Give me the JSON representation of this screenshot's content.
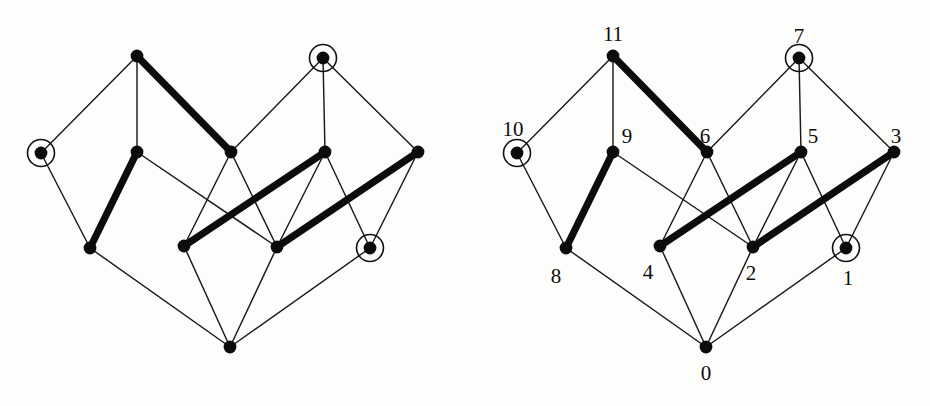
{
  "figure": {
    "background_color": "#fdfdfc",
    "ink_color": "#0b0b0b",
    "panels": [
      {
        "id": "left",
        "name": "unlabeled-graph",
        "x_offset": 0,
        "labels_visible": false
      },
      {
        "id": "right",
        "name": "labeled-graph",
        "x_offset": 476,
        "labels_visible": true
      }
    ]
  },
  "chart_data": {
    "type": "diagram",
    "title": "",
    "xlabel": "",
    "ylabel": "",
    "node_count": 12,
    "edge_count": 20,
    "nodes": [
      {
        "id": "0",
        "label": "0",
        "x": 230,
        "y": 347,
        "highlighted": false,
        "label_dx": 0,
        "label_dy": 26,
        "label_anchor": "middle"
      },
      {
        "id": "1",
        "label": "1",
        "x": 370,
        "y": 248,
        "highlighted": true,
        "label_dx": 2,
        "label_dy": 30,
        "label_anchor": "middle"
      },
      {
        "id": "2",
        "label": "2",
        "x": 277,
        "y": 247,
        "highlighted": false,
        "label_dx": -2,
        "label_dy": 26,
        "label_anchor": "middle"
      },
      {
        "id": "3",
        "label": "3",
        "x": 418,
        "y": 152,
        "highlighted": false,
        "label_dx": 2,
        "label_dy": -16,
        "label_anchor": "middle"
      },
      {
        "id": "4",
        "label": "4",
        "x": 184,
        "y": 246,
        "highlighted": false,
        "label_dx": -12,
        "label_dy": 26,
        "label_anchor": "middle"
      },
      {
        "id": "5",
        "label": "5",
        "x": 325,
        "y": 152,
        "highlighted": false,
        "label_dx": 12,
        "label_dy": -16,
        "label_anchor": "middle"
      },
      {
        "id": "6",
        "label": "6",
        "x": 231,
        "y": 152,
        "highlighted": false,
        "label_dx": -2,
        "label_dy": -16,
        "label_anchor": "middle"
      },
      {
        "id": "7",
        "label": "7",
        "x": 323,
        "y": 58,
        "highlighted": true,
        "label_dx": 0,
        "label_dy": -22,
        "label_anchor": "middle"
      },
      {
        "id": "8",
        "label": "8",
        "x": 90,
        "y": 248,
        "highlighted": false,
        "label_dx": -10,
        "label_dy": 28,
        "label_anchor": "middle"
      },
      {
        "id": "9",
        "label": "9",
        "x": 137,
        "y": 152,
        "highlighted": false,
        "label_dx": 14,
        "label_dy": -16,
        "label_anchor": "middle"
      },
      {
        "id": "10",
        "label": "10",
        "x": 41,
        "y": 153,
        "highlighted": true,
        "label_dx": -4,
        "label_dy": -24,
        "label_anchor": "middle"
      },
      {
        "id": "11",
        "label": "11",
        "x": 137,
        "y": 56,
        "highlighted": false,
        "label_dx": 0,
        "label_dy": -22,
        "label_anchor": "middle"
      }
    ],
    "edges": [
      {
        "from": "11",
        "to": "10",
        "weight": "thin"
      },
      {
        "from": "11",
        "to": "9",
        "weight": "thin"
      },
      {
        "from": "11",
        "to": "6",
        "weight": "thick"
      },
      {
        "from": "10",
        "to": "8",
        "weight": "thin"
      },
      {
        "from": "9",
        "to": "8",
        "weight": "thick"
      },
      {
        "from": "9",
        "to": "2",
        "weight": "thin"
      },
      {
        "from": "6",
        "to": "4",
        "weight": "thin"
      },
      {
        "from": "6",
        "to": "2",
        "weight": "thin"
      },
      {
        "from": "7",
        "to": "6",
        "weight": "thin"
      },
      {
        "from": "7",
        "to": "5",
        "weight": "thin"
      },
      {
        "from": "7",
        "to": "3",
        "weight": "thin"
      },
      {
        "from": "5",
        "to": "4",
        "weight": "thick"
      },
      {
        "from": "5",
        "to": "1",
        "weight": "thin"
      },
      {
        "from": "3",
        "to": "2",
        "weight": "thick"
      },
      {
        "from": "3",
        "to": "1",
        "weight": "thin"
      },
      {
        "from": "8",
        "to": "0",
        "weight": "thin"
      },
      {
        "from": "4",
        "to": "0",
        "weight": "thin"
      },
      {
        "from": "2",
        "to": "0",
        "weight": "thin"
      },
      {
        "from": "1",
        "to": "0",
        "weight": "thin"
      },
      {
        "from": "5",
        "to": "2",
        "weight": "thin"
      }
    ],
    "legend": {
      "thick_edge_meaning": "highlighted matching edge",
      "ring_meaning": "circled node"
    },
    "style": {
      "dot_radius": 6.4,
      "ring_radius": 13.5,
      "thin_stroke_width": 1.45,
      "thick_stroke_width": 7.2,
      "label_font_size": 21
    }
  }
}
